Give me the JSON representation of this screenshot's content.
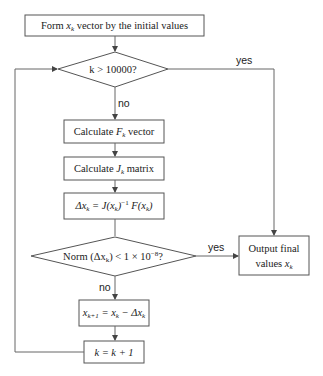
{
  "diagram": {
    "type": "flowchart",
    "nodes": {
      "init": {
        "pre": "Form ",
        "var": "x",
        "sub": "k",
        "post": " vector by the initial values"
      },
      "decision_iter": {
        "label": "k > 10000?"
      },
      "calc_f": {
        "pre": "Calculate ",
        "var": "F",
        "sub": "k",
        "post": " vector"
      },
      "calc_j": {
        "pre": "Calculate ",
        "var": "J",
        "sub": "k",
        "post": " matrix"
      },
      "delta": {
        "label": "Δx_k = J(x_k)^-1 F(x_k)",
        "p1": "Δx",
        "s1": "k",
        "p2": " = J(x",
        "s2": "k",
        "p3": ")",
        "sup": "−1",
        "p4": " F(x",
        "s3": "k",
        "p5": ")"
      },
      "decision_norm": {
        "label": "Norm (Δx_k) < 1 × 10^-8?",
        "p1": "Norm (Δx",
        "s1": "k",
        "p2": ") < 1 × 10",
        "sup": "−8",
        "p3": "?"
      },
      "update": {
        "label": "x_{k+1} = x_k − Δx_k",
        "p1": "x",
        "s1": "k+1",
        "p2": " = x",
        "s2": "k",
        "p3": " − Δx",
        "s3": "k"
      },
      "increment": {
        "label": "k = k + 1"
      },
      "output": {
        "line1": "Output final",
        "line2_pre": "values ",
        "line2_var": "x",
        "line2_sub": "k"
      }
    },
    "edge_labels": {
      "iter_yes": "yes",
      "iter_no": "no",
      "norm_yes": "yes",
      "norm_no": "no"
    },
    "colors": {
      "stroke": "#555555",
      "text": "#222222",
      "background": "#ffffff"
    }
  }
}
